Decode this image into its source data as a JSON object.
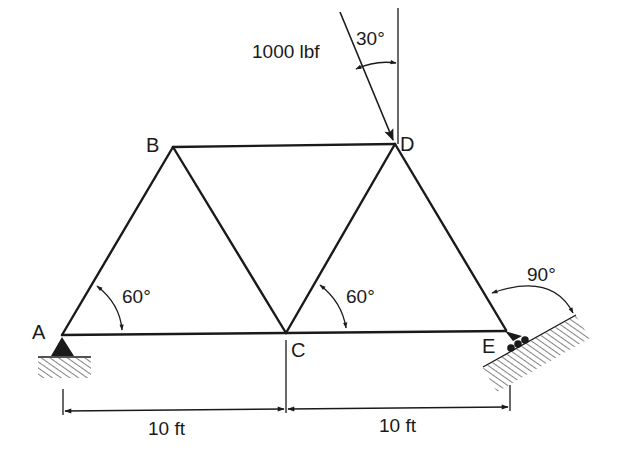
{
  "diagram": {
    "type": "truss",
    "joints": {
      "A": {
        "label": "A"
      },
      "B": {
        "label": "B"
      },
      "C": {
        "label": "C"
      },
      "D": {
        "label": "D"
      },
      "E": {
        "label": "E"
      }
    },
    "members": [
      "AB",
      "AC",
      "BC",
      "BD",
      "CD",
      "CE",
      "DE"
    ],
    "load": {
      "label": "1000 lbf",
      "angle_label": "30°",
      "at": "D"
    },
    "angles": {
      "A": "60°",
      "C": "60°",
      "E": "90°"
    },
    "dimensions": {
      "left": "10 ft",
      "right": "10 ft"
    },
    "supports": {
      "A": "pin",
      "E": "roller on inclined surface"
    },
    "colors": {
      "ink": "#1a1a1a",
      "background": "#ffffff"
    }
  }
}
